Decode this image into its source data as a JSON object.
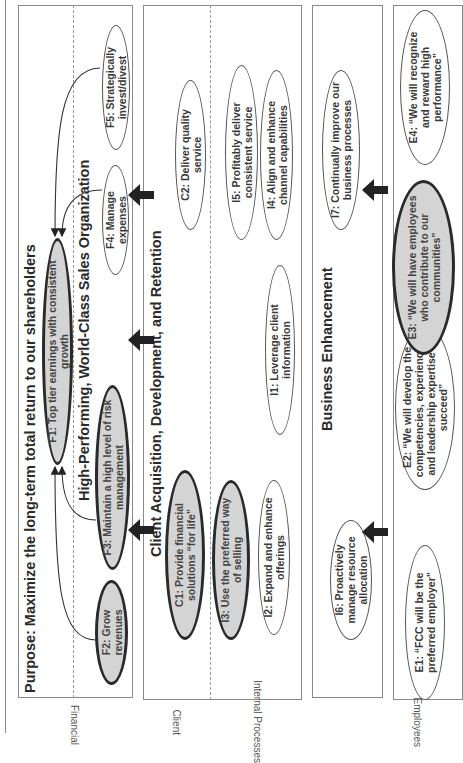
{
  "purpose_title": "Purpose: Maximize the long-term total return to our shareholders",
  "vision_title": "High-Performing, World-Class Sales Organization",
  "client_title": "Client Acquisition, Development, and Retention",
  "business_title": "Business Enhancement",
  "perspectives": {
    "financial": "Financial",
    "client": "Client",
    "internal": "Internal Processes",
    "employees": "Employees"
  },
  "objectives": {
    "F1": {
      "label": "F1: Top tier earnings with consistent growth",
      "key": true
    },
    "F2": {
      "label": "F2: Grow revenues",
      "key": true
    },
    "F3": {
      "label": "F3: Maintain a high level of risk management",
      "key": true
    },
    "F4": {
      "label": "F4: Manage expenses",
      "key": false
    },
    "F5": {
      "label": "F5: Strategically invest/divest",
      "key": false
    },
    "C1": {
      "label": "C1: Provide financial solutions “for life”",
      "key": true
    },
    "C2": {
      "label": "C2: Deliver quality service",
      "key": false
    },
    "I1": {
      "label": "I1: Leverage client information",
      "key": false
    },
    "I2": {
      "label": "I2: Expand and enhance offerings",
      "key": false
    },
    "I3": {
      "label": "I3: Use the preferred way of selling",
      "key": true
    },
    "I4": {
      "label": "I4: Align and enhance channel capabilities",
      "key": false
    },
    "I5": {
      "label": "I5: Profitably deliver consistent service",
      "key": false
    },
    "I6": {
      "label": "I6: Proactively manage resource allocation",
      "key": false
    },
    "I7": {
      "label": "I7: Continually improve our business processes",
      "key": false
    },
    "E1": {
      "label": "E1: “FCC will be the preferred employer”",
      "key": false
    },
    "E2": {
      "label": "E2: “We will develop the competencies, experiences, and leadership expertise to succeed”",
      "key": false
    },
    "E3": {
      "label": "E3: “We will have employees who contribute to our communities”",
      "key": true
    },
    "E4": {
      "label": "E4: “We will recognize and reward high performance”",
      "key": false
    }
  },
  "colors": {
    "key_fill": "#d4d4d4",
    "key_border": "#2a2a2a",
    "line": "#8a8a8a",
    "arrow": "#222222"
  }
}
